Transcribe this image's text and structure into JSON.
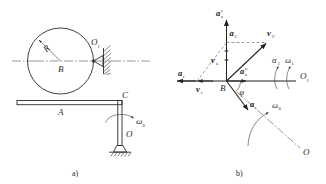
{
  "figure": {
    "title_a": "a)",
    "title_b": "b)"
  },
  "panel_a": {
    "caption": "a)",
    "labels": {
      "radius": "R",
      "wheel_center": "B",
      "bearing": "O",
      "bearing_sub": "1",
      "bar_point": "A",
      "corner_point": "C",
      "pivot": "O",
      "angular_velocity": "ω",
      "angular_velocity_sub": "0"
    },
    "parts": [
      {
        "name": "wheel",
        "label": "B",
        "note": "circle of radius R"
      },
      {
        "name": "radius-arrow",
        "label": "R"
      },
      {
        "name": "bearing-support",
        "label": "O₁"
      },
      {
        "name": "horizontal-bar",
        "label": "A"
      },
      {
        "name": "corner",
        "label": "C"
      },
      {
        "name": "vertical-post",
        "label": "O"
      },
      {
        "name": "ground-support",
        "label": ""
      },
      {
        "name": "rotation-arrow",
        "label": "ω₀"
      }
    ]
  },
  "panel_b": {
    "caption": "b)",
    "origin_label": "B",
    "axis_right_label": "O",
    "axis_right_sub": "1",
    "axis_lower_label": "O",
    "angle_label": "φ",
    "vectors": [
      {
        "name": "a-a-t",
        "base": "a",
        "sub": "a",
        "sup": "t",
        "dir": "up",
        "desc": "absolute tangential acceleration"
      },
      {
        "name": "a-C",
        "base": "a",
        "sub": "C",
        "sup": "",
        "dir": "up",
        "desc": "Coriolis acceleration"
      },
      {
        "name": "v-C",
        "base": "v",
        "sub": "C",
        "sup": "",
        "dir": "up-right",
        "desc": "velocity of point C"
      },
      {
        "name": "v-a",
        "base": "v",
        "sub": "a",
        "sup": "",
        "dir": "up-left",
        "desc": "absolute velocity"
      },
      {
        "name": "v-r",
        "base": "v",
        "sub": "r",
        "sup": "",
        "dir": "left",
        "desc": "relative velocity"
      },
      {
        "name": "a-r",
        "base": "a",
        "sub": "r",
        "sup": "",
        "dir": "left",
        "desc": "relative acceleration"
      },
      {
        "name": "a-a-n",
        "base": "a",
        "sub": "a",
        "sup": "n",
        "dir": "right",
        "desc": "absolute normal acceleration"
      },
      {
        "name": "a-e",
        "base": "a",
        "sub": "e",
        "sup": "",
        "dir": "down-right",
        "desc": "transport acceleration"
      }
    ],
    "rotations": [
      {
        "name": "alpha-1",
        "base": "α",
        "sub": "1",
        "desc": "angular acceleration about O1"
      },
      {
        "name": "omega-1",
        "base": "ω",
        "sub": "1",
        "desc": "angular velocity about O1"
      },
      {
        "name": "omega-0",
        "base": "ω",
        "sub": "0",
        "desc": "angular velocity about O"
      }
    ]
  },
  "colors": {
    "ink": "#2b2b2b",
    "ink_dark": "#1d1d1d",
    "axis": "#555555",
    "dashed": "#777777",
    "background": "#ffffff"
  }
}
